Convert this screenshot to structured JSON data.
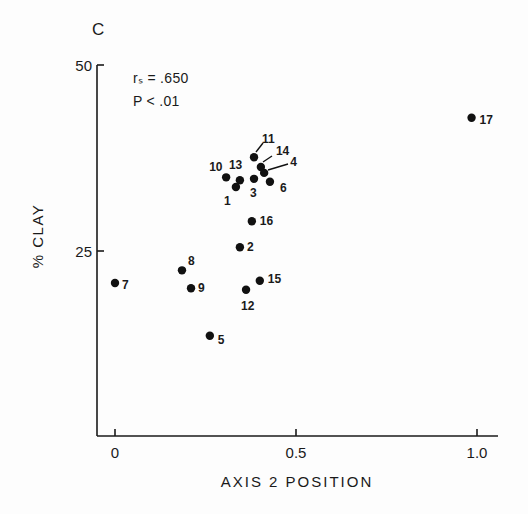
{
  "panel": {
    "letter": "C"
  },
  "stats": {
    "line1": "rₛ = .650",
    "line2": "P < .01"
  },
  "chart_data": {
    "type": "scatter",
    "title": "",
    "panel_label": "C",
    "xlabel": "AXIS 2 POSITION",
    "ylabel": "% CLAY",
    "xlim": [
      -0.1,
      1.12
    ],
    "ylim": [
      0,
      50
    ],
    "xticks": [
      0,
      0.5,
      1.0
    ],
    "xtick_labels": [
      "0",
      "0.5",
      "1.0"
    ],
    "yticks": [
      25,
      50
    ],
    "ytick_labels": [
      "25",
      "50"
    ],
    "grid": false,
    "annotations": [
      "rₛ = .650",
      "P < .01"
    ],
    "points": [
      {
        "label": "1",
        "x": 0.334,
        "y": 33.6
      },
      {
        "label": "2",
        "x": 0.345,
        "y": 25.5
      },
      {
        "label": "3",
        "x": 0.384,
        "y": 34.7
      },
      {
        "label": "4",
        "x": 0.412,
        "y": 35.5
      },
      {
        "label": "5",
        "x": 0.262,
        "y": 13.6
      },
      {
        "label": "6",
        "x": 0.428,
        "y": 34.3
      },
      {
        "label": "7",
        "x": 0.0,
        "y": 20.7
      },
      {
        "label": "8",
        "x": 0.185,
        "y": 22.4
      },
      {
        "label": "9",
        "x": 0.21,
        "y": 20.0
      },
      {
        "label": "10",
        "x": 0.307,
        "y": 34.9
      },
      {
        "label": "11",
        "x": 0.384,
        "y": 37.6
      },
      {
        "label": "12",
        "x": 0.362,
        "y": 19.8
      },
      {
        "label": "13",
        "x": 0.345,
        "y": 34.5
      },
      {
        "label": "14",
        "x": 0.403,
        "y": 36.3
      },
      {
        "label": "15",
        "x": 0.4,
        "y": 21.0
      },
      {
        "label": "16",
        "x": 0.378,
        "y": 29.0
      },
      {
        "label": "17",
        "x": 0.985,
        "y": 42.9
      }
    ]
  }
}
